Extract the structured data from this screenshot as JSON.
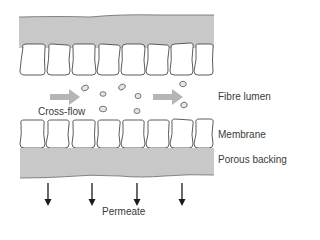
{
  "diagram": {
    "type": "cross-section of hollow fibre membrane with cross-flow filtration",
    "labels": {
      "cross_flow": "Cross-flow",
      "fibre_lumen": "Fibre lumen",
      "membrane": "Membrane",
      "porous_backing": "Porous backing",
      "permeate": "Permeate"
    },
    "colors": {
      "backing_fill": "#c8c8c8",
      "cell_stroke": "#4a4a4a",
      "flow_arrow": "#b5b5b5",
      "particle_fill": "#e6e6e6",
      "permeate_arrow": "#1a1a1a",
      "text": "#3a3a3a"
    },
    "membrane_cells_per_row": 8,
    "flow_arrows": 2,
    "permeate_arrows": 4
  }
}
